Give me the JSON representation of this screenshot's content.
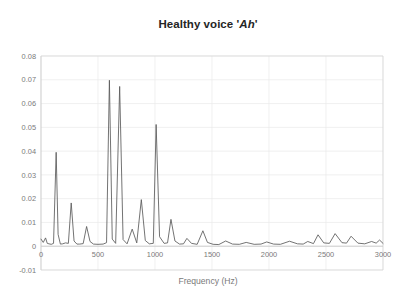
{
  "figure": {
    "background_color": "#ffffff",
    "title_prefix": "Healthy voice '",
    "title_emphasis": "Ah",
    "title_suffix": "'",
    "title_full": "Healthy voice 'Ah'"
  },
  "chart_data": {
    "type": "line",
    "title": "Healthy voice 'Ah'",
    "xlabel": "Frequency (Hz)",
    "ylabel": "",
    "xlim": [
      0,
      3000
    ],
    "ylim": [
      -0.01,
      0.08
    ],
    "grid": true,
    "legend": null,
    "line_color": "#5a5a5a",
    "xticks": [
      0,
      500,
      1000,
      1500,
      2000,
      2500,
      3000
    ],
    "xticklabels": [
      "0",
      "500",
      "1000",
      "1500",
      "2000",
      "2500",
      "3000"
    ],
    "yticks": [
      -0.01,
      0,
      0.01,
      0.02,
      0.03,
      0.04,
      0.05,
      0.06,
      0.07,
      0.08
    ],
    "yticklabels": [
      "-0.01",
      "0",
      "0.01",
      "0.02",
      "0.03",
      "0.04",
      "0.05",
      "0.06",
      "0.07",
      "0.08"
    ],
    "peaks": [
      {
        "x": 133,
        "y": 0.0395
      },
      {
        "x": 265,
        "y": 0.0182
      },
      {
        "x": 400,
        "y": 0.0083
      },
      {
        "x": 600,
        "y": 0.0698
      },
      {
        "x": 690,
        "y": 0.0672
      },
      {
        "x": 800,
        "y": 0.0072
      },
      {
        "x": 880,
        "y": 0.0196
      },
      {
        "x": 1010,
        "y": 0.0512
      },
      {
        "x": 1140,
        "y": 0.0113
      },
      {
        "x": 1280,
        "y": 0.0033
      },
      {
        "x": 1420,
        "y": 0.0065
      },
      {
        "x": 1620,
        "y": 0.0022
      },
      {
        "x": 1800,
        "y": 0.0016
      },
      {
        "x": 1980,
        "y": 0.0018
      },
      {
        "x": 2180,
        "y": 0.0021
      },
      {
        "x": 2340,
        "y": 0.002
      },
      {
        "x": 2430,
        "y": 0.0048
      },
      {
        "x": 2580,
        "y": 0.0053
      },
      {
        "x": 2720,
        "y": 0.0042
      },
      {
        "x": 2900,
        "y": 0.002
      },
      {
        "x": 2970,
        "y": 0.0026
      }
    ],
    "baseline": 0.0008,
    "series": [
      {
        "name": "spectrum",
        "x": [
          0,
          20,
          40,
          55,
          70,
          90,
          110,
          133,
          150,
          170,
          190,
          215,
          240,
          265,
          290,
          315,
          340,
          370,
          400,
          430,
          460,
          500,
          545,
          575,
          600,
          625,
          655,
          690,
          720,
          755,
          800,
          840,
          880,
          915,
          950,
          985,
          1010,
          1040,
          1080,
          1110,
          1140,
          1175,
          1215,
          1250,
          1280,
          1320,
          1370,
          1420,
          1460,
          1510,
          1560,
          1620,
          1680,
          1740,
          1800,
          1870,
          1930,
          1980,
          2040,
          2100,
          2180,
          2250,
          2300,
          2340,
          2390,
          2430,
          2480,
          2530,
          2580,
          2640,
          2680,
          2720,
          2780,
          2840,
          2900,
          2940,
          2970,
          3000
        ],
        "y": [
          0.003,
          0.0016,
          0.0035,
          0.0012,
          0.001,
          0.0008,
          0.0012,
          0.0395,
          0.005,
          0.0009,
          0.001,
          0.0014,
          0.0012,
          0.0182,
          0.0022,
          0.0009,
          0.0009,
          0.0011,
          0.0083,
          0.002,
          0.0009,
          0.0008,
          0.0009,
          0.0015,
          0.0698,
          0.003,
          0.0012,
          0.0672,
          0.0028,
          0.001,
          0.0072,
          0.0014,
          0.0196,
          0.0024,
          0.001,
          0.0012,
          0.0512,
          0.004,
          0.0012,
          0.0014,
          0.0113,
          0.0022,
          0.0009,
          0.001,
          0.0033,
          0.0012,
          0.0008,
          0.0065,
          0.0016,
          0.0008,
          0.0007,
          0.0022,
          0.0009,
          0.0008,
          0.0016,
          0.0008,
          0.0009,
          0.0018,
          0.0009,
          0.0008,
          0.0021,
          0.001,
          0.0009,
          0.002,
          0.0011,
          0.0048,
          0.0014,
          0.0012,
          0.0053,
          0.0015,
          0.0013,
          0.0042,
          0.0013,
          0.001,
          0.002,
          0.0013,
          0.0026,
          0.0012
        ]
      }
    ]
  },
  "axes": {
    "x_axis_title": "Frequency (Hz)"
  }
}
